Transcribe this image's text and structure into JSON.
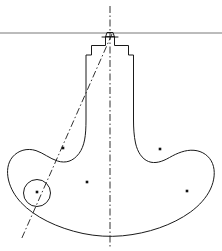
{
  "canvas": {
    "width": 222,
    "height": 251,
    "background": "#ffffff",
    "title": "Mechanical part outline drawing"
  },
  "style": {
    "outline_color": "#1a1a1a",
    "outline_width": 1.0,
    "centerline_color": "#1a1a1a",
    "centerline_width": 0.9,
    "reference_line_color": "#555555",
    "reference_line_width": 0.8,
    "dot_color": "#111111",
    "dash_pattern": "7,2.5,1.5,2.5"
  },
  "geometry": {
    "part_outline": {
      "name": "part-outline",
      "path": "M 105.5 37.0 L 105.5 45.5 L 91.5 45.5 L 91.5 55.0 L 86.0 55.0 L 86.0 120.0 C 86.0 136.0 84.5 146.0 79.0 153.5 C 73.0 161.5 65.5 163.5 57.5 161.0 C 50.0 158.7 43.0 152.8 36.0 150.6 C 27.0 147.7 18.0 150.5 12.5 157.0 C 7.5 163.0 6.5 171.5 8.5 180.0 C 10.5 188.5 15.0 196.0 21.0 202.5 C 34.0 216.5 57.0 228.0 83.0 233.5 C 96.0 236.2 109.5 237.0 122.5 235.8 C 148.0 233.4 172.5 225.0 190.5 212.0 C 199.5 205.4 206.5 197.5 210.5 189.0 C 214.5 180.4 215.5 171.0 212.5 163.5 C 209.5 156.0 202.5 151.0 194.0 150.3 C 185.5 149.6 177.0 153.2 169.5 157.5 C 162.0 161.8 155.0 164.0 148.5 161.5 C 142.0 159.0 137.5 152.0 135.5 143.0 C 134.0 136.0 133.5 128.0 133.5 120.0 L 133.5 55.0 L 128.5 55.0 L 128.5 45.5 L 114.5 45.5 L 114.5 37.0 Z",
      "fill": "none"
    },
    "top_cap": {
      "name": "top-cap",
      "path": "M 105.5 37.0 L 107.0 32.5 L 113.0 32.5 L 114.5 37.0",
      "note": "trapezoidal cap above reference line level"
    },
    "top_cap_base": {
      "name": "top-cap-base-line",
      "path": "M 102.0 37.0 L 118.0 37.0"
    },
    "left_lobe_circle": {
      "name": "detail-circle",
      "cx": 37.0,
      "cy": 193.0,
      "r": 13.5
    },
    "reference_line": {
      "name": "horizontal-reference-line",
      "x1": 0,
      "y1": 33.0,
      "x2": 222,
      "y2": 33.0
    },
    "vertical_centerline": {
      "name": "vertical-centerline",
      "x1": 110.0,
      "y1": 6.0,
      "x2": 110.0,
      "y2": 248.0
    },
    "diagonal_centerline": {
      "name": "diagonal-construction-line",
      "x1": 112.0,
      "y1": 34.0,
      "x2": 21.0,
      "y2": 240.0
    },
    "center_dots": [
      {
        "name": "center-mark-upper-left",
        "cx": 63.0,
        "cy": 148.0,
        "size": 2.6
      },
      {
        "name": "center-mark-upper-right",
        "cx": 160.0,
        "cy": 149.0,
        "size": 2.6
      },
      {
        "name": "center-mark-lower-middle",
        "cx": 87.0,
        "cy": 182.0,
        "size": 2.6
      },
      {
        "name": "center-mark-lower-right",
        "cx": 187.0,
        "cy": 191.0,
        "size": 2.6
      },
      {
        "name": "center-mark-in-circle",
        "cx": 37.0,
        "cy": 192.0,
        "size": 2.6
      }
    ]
  }
}
